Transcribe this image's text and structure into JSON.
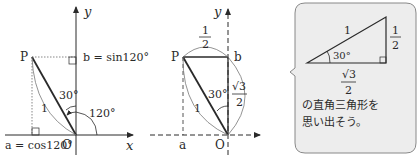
{
  "figure1": {
    "axis_y_label": "y",
    "axis_x_label": "x",
    "point_p": "P",
    "origin": "O",
    "b_label": "b = sin120°",
    "a_label": "a = cos120°",
    "angle_30": "30°",
    "angle_120": "120°",
    "radius_label": "1"
  },
  "figure2": {
    "axis_y_label": "y",
    "axis_x_label": "x",
    "point_p": "P",
    "point_b": "b",
    "point_a": "a",
    "origin": "O",
    "angle_30": "30°",
    "top_frac_num": "1",
    "top_frac_den": "2",
    "right_frac_num": "√3",
    "right_frac_den": "2",
    "hyp_label": "1"
  },
  "bubble": {
    "hyp_label": "1",
    "angle_30": "30°",
    "vert_frac_num": "1",
    "vert_frac_den": "2",
    "horiz_frac_num": "√3",
    "horiz_frac_den": "2",
    "text_line1": "の直角三角形を",
    "text_line2": "思い出そう。",
    "bg_color": "#ededed",
    "border_color": "#888888"
  }
}
